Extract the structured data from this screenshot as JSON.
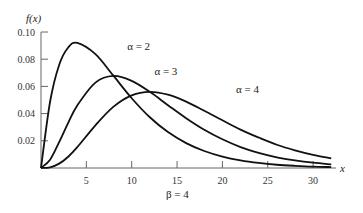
{
  "chart_data": {
    "type": "line",
    "title": "",
    "xlabel": "x",
    "ylabel": "f(x)",
    "subtitle": "β = 4",
    "xlim": [
      0,
      33
    ],
    "ylim": [
      0,
      0.1
    ],
    "grid": false,
    "legend": "inline annotations",
    "x_ticks": [
      "5",
      "10",
      "15",
      "20",
      "25",
      "30"
    ],
    "y_ticks": [
      "0.10",
      "0.08",
      "0.06",
      "0.04",
      "0.02"
    ],
    "x": [
      0,
      1,
      2,
      3,
      4,
      6,
      8,
      10,
      12,
      14,
      16,
      18,
      20,
      22,
      24,
      26,
      28,
      30,
      32
    ],
    "series": [
      {
        "name": "α = 2",
        "values": [
          0,
          0.0487,
          0.0758,
          0.0886,
          0.092,
          0.0837,
          0.0677,
          0.0513,
          0.0373,
          0.0264,
          0.0183,
          0.0125,
          0.0084,
          0.0056,
          0.0037,
          0.0024,
          0.0016,
          0.001,
          0.0007
        ]
      },
      {
        "name": "α = 3",
        "values": [
          0,
          0.0061,
          0.019,
          0.0332,
          0.046,
          0.0628,
          0.0677,
          0.0641,
          0.056,
          0.0462,
          0.0366,
          0.0281,
          0.0211,
          0.0154,
          0.0112,
          0.0079,
          0.0056,
          0.0039,
          0.0027
        ]
      },
      {
        "name": "α = 4",
        "values": [
          0,
          0.0005,
          0.0032,
          0.0083,
          0.0153,
          0.0314,
          0.0451,
          0.0534,
          0.056,
          0.0539,
          0.0488,
          0.0421,
          0.0351,
          0.0282,
          0.0224,
          0.0171,
          0.013,
          0.0097,
          0.0071
        ]
      }
    ],
    "annotations": [
      {
        "text": "α = 2",
        "x": 9.5,
        "y": 0.09
      },
      {
        "text": "α = 3",
        "x": 12.5,
        "y": 0.071
      },
      {
        "text": "α = 4",
        "x": 21.5,
        "y": 0.058
      }
    ]
  }
}
